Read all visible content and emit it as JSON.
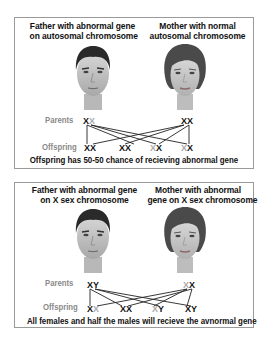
{
  "panels": [
    {
      "id": "autosomal",
      "father_caption_line1": "Father with abnormal gene",
      "father_caption_line2": "on autosomal chromosome",
      "mother_caption_line1": "Mother with normal",
      "mother_caption_line2": "autosomal chromosome",
      "parents_label": "Parents",
      "offspring_label": "Offspring",
      "father_chromosomes": [
        {
          "symbol": "X",
          "abnormal": true
        },
        {
          "symbol": "X",
          "abnormal": false
        }
      ],
      "mother_chromosomes": [
        {
          "symbol": "X",
          "abnormal": true
        },
        {
          "symbol": "X",
          "abnormal": true
        }
      ],
      "offspring": [
        [
          {
            "symbol": "X",
            "abnormal": true
          },
          {
            "symbol": "X",
            "abnormal": true
          }
        ],
        [
          {
            "symbol": "X",
            "abnormal": true
          },
          {
            "symbol": "X",
            "abnormal": true
          }
        ],
        [
          {
            "symbol": "X",
            "abnormal": false
          },
          {
            "symbol": "X",
            "abnormal": true
          }
        ],
        [
          {
            "symbol": "X",
            "abnormal": false
          },
          {
            "symbol": "X",
            "abnormal": true
          }
        ]
      ],
      "summary": "Offspring has 50-50 chance of recieving abnormal gene"
    },
    {
      "id": "x-linked",
      "father_caption_line1": "Father with abnormal gene",
      "father_caption_line2": "on X sex chromosome",
      "mother_caption_line1": "Mother with abnormal",
      "mother_caption_line2": "gene on X sex chromosome",
      "parents_label": "Parents",
      "offspring_label": "Offspring",
      "father_chromosomes": [
        {
          "symbol": "X",
          "abnormal": true
        },
        {
          "symbol": "Y",
          "abnormal": true
        }
      ],
      "mother_chromosomes": [
        {
          "symbol": "X",
          "abnormal": false
        },
        {
          "symbol": "X",
          "abnormal": true
        }
      ],
      "offspring": [
        [
          {
            "symbol": "X",
            "abnormal": true
          },
          {
            "symbol": "X",
            "abnormal": false
          }
        ],
        [
          {
            "symbol": "X",
            "abnormal": true
          },
          {
            "symbol": "X",
            "abnormal": true
          }
        ],
        [
          {
            "symbol": "X",
            "abnormal": false
          },
          {
            "symbol": "Y",
            "abnormal": true
          }
        ],
        [
          {
            "symbol": "X",
            "abnormal": true
          },
          {
            "symbol": "Y",
            "abnormal": true
          }
        ]
      ],
      "summary": "All females and half the males will recieve the avnormal gene"
    }
  ],
  "colors": {
    "abnormal": "#111111",
    "normal": "#aaaaaa",
    "label": "#8a8a8a",
    "border": "#9a9a9a"
  }
}
